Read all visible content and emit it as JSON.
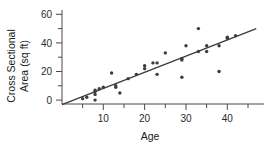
{
  "chart_data": {
    "type": "scatter",
    "title": "",
    "subtitle": "",
    "xlabel": "Age",
    "ylabel": "Cross Sectional Area (sq ft)",
    "ylabel_line1": "Cross Sectional",
    "ylabel_line2": "Area (sq ft)",
    "xlim": [
      0,
      47
    ],
    "ylim": [
      -5,
      62
    ],
    "grid": false,
    "legend": null,
    "x_ticks_major": [
      10,
      20,
      30,
      40
    ],
    "x_ticks_minor": [
      5,
      15,
      25,
      35,
      45
    ],
    "y_ticks_major": [
      0,
      20,
      40,
      60
    ],
    "y_ticks_minor": [
      10,
      30,
      50
    ],
    "x_tick_labels": [
      "10",
      "20",
      "30",
      "40"
    ],
    "y_tick_labels": [
      "0",
      "20",
      "40",
      "60"
    ],
    "point_color": "#3c3c3c",
    "line_color": "#3a3a3a",
    "axis_color": "#4a4a4a",
    "x": [
      5,
      6,
      8,
      8,
      8,
      8,
      9,
      10,
      12,
      13,
      13,
      14,
      16,
      18,
      20,
      20,
      22,
      23,
      23,
      25,
      29,
      29,
      29,
      30,
      33,
      33,
      35,
      35,
      38,
      38,
      40,
      40,
      42
    ],
    "y": [
      1,
      2,
      7,
      6,
      4,
      0,
      8,
      9,
      19,
      10,
      9,
      5,
      15,
      18,
      24,
      22,
      26,
      26,
      18,
      33,
      29,
      28,
      16,
      38,
      50,
      34,
      38,
      34,
      38,
      20,
      44,
      43,
      45
    ],
    "points": [
      {
        "x": 5,
        "y": 1
      },
      {
        "x": 6,
        "y": 2
      },
      {
        "x": 8,
        "y": 7
      },
      {
        "x": 8,
        "y": 6
      },
      {
        "x": 8,
        "y": 4
      },
      {
        "x": 8,
        "y": 0
      },
      {
        "x": 9,
        "y": 8
      },
      {
        "x": 10,
        "y": 9
      },
      {
        "x": 12,
        "y": 19
      },
      {
        "x": 13,
        "y": 10
      },
      {
        "x": 13,
        "y": 9
      },
      {
        "x": 14,
        "y": 5
      },
      {
        "x": 16,
        "y": 15
      },
      {
        "x": 18,
        "y": 18
      },
      {
        "x": 20,
        "y": 24
      },
      {
        "x": 20,
        "y": 22
      },
      {
        "x": 22,
        "y": 26
      },
      {
        "x": 23,
        "y": 26
      },
      {
        "x": 23,
        "y": 18
      },
      {
        "x": 25,
        "y": 33
      },
      {
        "x": 29,
        "y": 29
      },
      {
        "x": 29,
        "y": 28
      },
      {
        "x": 29,
        "y": 16
      },
      {
        "x": 30,
        "y": 38
      },
      {
        "x": 33,
        "y": 50
      },
      {
        "x": 33,
        "y": 34
      },
      {
        "x": 35,
        "y": 38
      },
      {
        "x": 35,
        "y": 34
      },
      {
        "x": 38,
        "y": 38
      },
      {
        "x": 38,
        "y": 20
      },
      {
        "x": 40,
        "y": 44
      },
      {
        "x": 40,
        "y": 43
      },
      {
        "x": 42,
        "y": 45
      }
    ],
    "trend_line": {
      "type": "linear-fit",
      "x_start": 0,
      "y_start": -3.2,
      "x_end": 47,
      "y_end": 50.0,
      "slope": 1.132,
      "intercept": -3.2
    }
  }
}
